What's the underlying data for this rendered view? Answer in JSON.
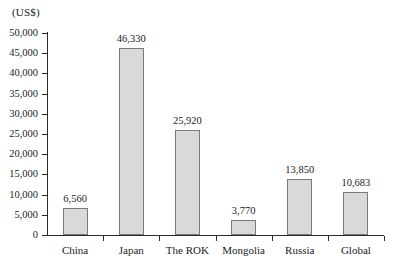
{
  "chart_data": {
    "type": "bar",
    "title": "",
    "xlabel": "",
    "ylabel": "(US$)",
    "unit_caption": "(US$)",
    "categories": [
      "China",
      "Japan",
      "The ROK",
      "Mongolia",
      "Russia",
      "Global"
    ],
    "values": [
      6560,
      46330,
      25920,
      3770,
      13850,
      10683
    ],
    "value_labels": [
      "6,560",
      "46,330",
      "25,920",
      "3,770",
      "13,850",
      "10,683"
    ],
    "ylim": [
      0,
      50000
    ],
    "ytick_step": 5000,
    "ytick_labels": [
      "0",
      "5,000",
      "10,000",
      "15,000",
      "20,000",
      "25,000",
      "30,000",
      "35,000",
      "40,000",
      "45,000",
      "50,000"
    ],
    "ytick_values": [
      0,
      5000,
      10000,
      15000,
      20000,
      25000,
      30000,
      35000,
      40000,
      45000,
      50000
    ],
    "grid": false,
    "legend": false,
    "legend_position": "none",
    "bar_fill_color": "#d9d9d9",
    "bar_border_color": "#7a7a7a",
    "axis_color": "#2b2b2b"
  }
}
